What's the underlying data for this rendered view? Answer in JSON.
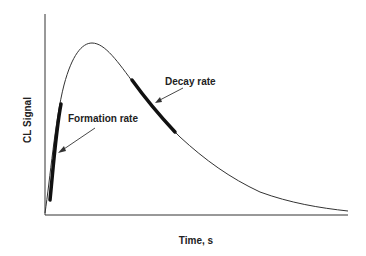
{
  "diagram": {
    "title": "",
    "axes": {
      "ylabel": "CL Signal",
      "xlabel": "Time, s"
    },
    "annotations": [
      {
        "id": "formation",
        "label": "Formation rate",
        "target": "rising edge of curve (thick segment)"
      },
      {
        "id": "decay",
        "label": "Decay rate",
        "target": "falling edge of curve after peak (thick segment)"
      }
    ],
    "curve": {
      "description": "Chemiluminescence signal rises steeply to a peak then decays exponentially toward baseline",
      "shape": "rise-peak-decay"
    },
    "colors": {
      "line": "#333333",
      "background": "#ffffff"
    }
  }
}
